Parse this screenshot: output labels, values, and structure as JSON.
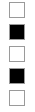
{
  "swatches": [
    {
      "name": "swatch-1",
      "fill": "#ffffff",
      "top": 2
    },
    {
      "name": "swatch-2",
      "fill": "#000000",
      "top": 24
    },
    {
      "name": "swatch-3",
      "fill": "#ffffff",
      "top": 46
    },
    {
      "name": "swatch-4",
      "fill": "#000000",
      "top": 68
    },
    {
      "name": "swatch-5",
      "fill": "#ffffff",
      "top": 90
    }
  ],
  "colors": {
    "border": "#9a9a9a",
    "light": "#ffffff",
    "dark": "#000000"
  }
}
